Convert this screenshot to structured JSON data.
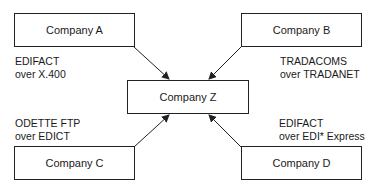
{
  "diagram": {
    "center": {
      "id": "Z",
      "label": "Company Z"
    },
    "nodes": [
      {
        "id": "A",
        "label": "Company A",
        "protocol_line1": "EDIFACT",
        "protocol_line2": "over X.400"
      },
      {
        "id": "B",
        "label": "Company B",
        "protocol_line1": "TRADACOMS",
        "protocol_line2": "over TRADANET"
      },
      {
        "id": "C",
        "label": "Company C",
        "protocol_line1": "ODETTE FTP",
        "protocol_line2": "over EDICT"
      },
      {
        "id": "D",
        "label": "Company D",
        "protocol_line1": "EDIFACT",
        "protocol_line2": "over EDI* Express"
      }
    ],
    "edges": [
      {
        "from": "A",
        "to": "Z"
      },
      {
        "from": "B",
        "to": "Z"
      },
      {
        "from": "C",
        "to": "Z"
      },
      {
        "from": "D",
        "to": "Z"
      }
    ]
  }
}
